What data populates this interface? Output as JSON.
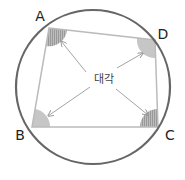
{
  "diagram": {
    "type": "cyclic-quadrilateral",
    "center_label": "대각",
    "colors": {
      "circle": "#666666",
      "quad": "#bbbbbb",
      "arrow": "#999999",
      "angle_solid": "#c8c8c8",
      "angle_hatched": "#a8a8a8",
      "text": "#222222"
    },
    "circle": {
      "cx": 93,
      "cy": 87,
      "r": 77
    },
    "vertices": [
      {
        "id": "A",
        "label": "A",
        "x": 49,
        "y": 28,
        "lx": 40,
        "ly": 21,
        "angle_style": "hatched"
      },
      {
        "id": "D",
        "label": "D",
        "x": 155,
        "y": 40,
        "lx": 163,
        "ly": 39,
        "angle_style": "solid"
      },
      {
        "id": "C",
        "label": "C",
        "x": 158,
        "y": 127,
        "lx": 170,
        "ly": 140,
        "angle_style": "hatched"
      },
      {
        "id": "B",
        "label": "B",
        "x": 32,
        "y": 127,
        "lx": 20,
        "ly": 140,
        "angle_style": "solid"
      }
    ],
    "arrows": [
      {
        "from": "center",
        "to": "A"
      },
      {
        "from": "center",
        "to": "D"
      },
      {
        "from": "center",
        "to": "B"
      },
      {
        "from": "center",
        "to": "C"
      }
    ]
  }
}
